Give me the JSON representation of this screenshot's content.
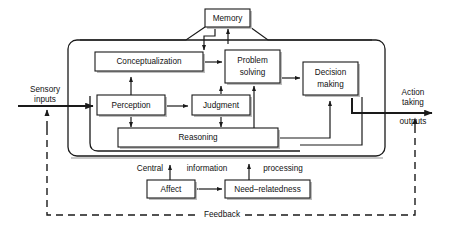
{
  "diagram": {
    "colors": {
      "line": "#1a1a1a",
      "shadow": "#bdbdbd",
      "background": "#ffffff"
    },
    "nodes": [
      {
        "id": "memory",
        "label": "Memory",
        "line1": "Memory",
        "line2": ""
      },
      {
        "id": "conceptualization",
        "label": "Conceptualization",
        "line1": "Conceptualization",
        "line2": ""
      },
      {
        "id": "problem-solving",
        "label": "Problem solving",
        "line1": "Problem",
        "line2": "solving"
      },
      {
        "id": "decision-making",
        "label": "Decision making",
        "line1": "Decision",
        "line2": "making"
      },
      {
        "id": "perception",
        "label": "Perception",
        "line1": "Perception",
        "line2": ""
      },
      {
        "id": "judgment",
        "label": "Judgment",
        "line1": "Judgment",
        "line2": ""
      },
      {
        "id": "reasoning",
        "label": "Reasoning",
        "line1": "Reasoning",
        "line2": ""
      },
      {
        "id": "affect",
        "label": "Affect",
        "line1": "Affect",
        "line2": ""
      },
      {
        "id": "need-relatedness",
        "label": "Need-relatedness",
        "line1": "Need–relatedness",
        "line2": ""
      }
    ],
    "edge_labels": {
      "sensory_line1": "Sensory",
      "sensory_line2": "inputs",
      "action_line1": "Action",
      "action_line2": "taking",
      "action_line3": "outputs",
      "central": "Central",
      "information": "information",
      "processing": "processing",
      "feedback": "Feedback"
    }
  }
}
